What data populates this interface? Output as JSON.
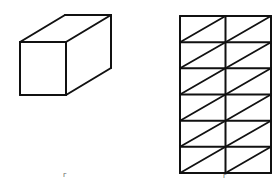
{
  "figures": [
    {
      "id": "cuboid",
      "type": "3d-rectangular-prism",
      "label": "",
      "front_face": {
        "x1": 20,
        "y1": 42,
        "x2": 66,
        "y2": 95
      },
      "depth_offset": {
        "dx": 45,
        "dy": -27
      },
      "stroke": "#111111",
      "stroke_width": 2
    },
    {
      "id": "triangulated-net",
      "type": "grid-with-diagonals",
      "label": "",
      "x": 180,
      "y": 16,
      "width": 91,
      "height": 157,
      "columns": 2,
      "rows": 6,
      "diagonal": "bottom-left-to-top-right",
      "stroke": "#111111",
      "stroke_width": 2
    }
  ],
  "marks": [
    {
      "text": "г",
      "x": 63,
      "y": 172
    },
    {
      "text": "г",
      "x": 223,
      "y": 173
    }
  ]
}
